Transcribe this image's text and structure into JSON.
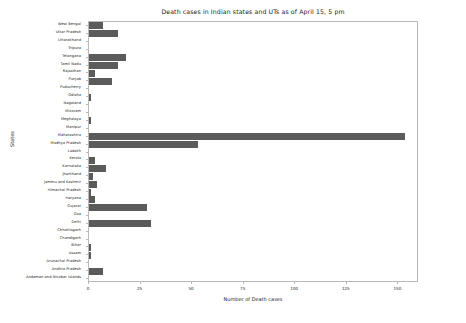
{
  "chart_data": {
    "type": "bar",
    "orientation": "horizontal",
    "title": "Death cases in Indian states and UTs as of April 15, 5 pm",
    "xlabel": "Number of Death cases",
    "ylabel": "States",
    "xlim": [
      0,
      160
    ],
    "ylim": [
      0,
      33
    ],
    "grid": false,
    "legend": null,
    "xticks": [
      0,
      25,
      50,
      75,
      100,
      125,
      150
    ],
    "xtick_labels": [
      "0",
      "25",
      "50",
      "75",
      "100",
      "125",
      "150"
    ],
    "bar_color": "#5b5b5b",
    "categories": [
      "West Bengal",
      "Uttar Pradesh",
      "Uttarakhand",
      "Tripura",
      "Telangana",
      "Tamil Nadu",
      "Rajasthan",
      "Punjab",
      "Puducherry",
      "Odisha",
      "Nagaland",
      "Mizoram",
      "Meghalaya",
      "Manipur",
      "Maharashtra",
      "Madhya Pradesh",
      "Ladakh",
      "Kerala",
      "Karnataka",
      "Jharkhand",
      "Jammu and Kashmir",
      "Himachal Pradesh",
      "Haryana",
      "Gujarat",
      "Goa",
      "Delhi",
      "Chhattisgarh",
      "Chandigarh",
      "Bihar",
      "Assam",
      "Arunachal Pradesh",
      "Andhra Pradesh",
      "Andaman and Nicobar Islands"
    ],
    "values": [
      7,
      14,
      0,
      0,
      18,
      14,
      3,
      11,
      0,
      1,
      0,
      0,
      1,
      0,
      153,
      53,
      0,
      3,
      8,
      2,
      4,
      1,
      3,
      28,
      0,
      30,
      0,
      0,
      1,
      1,
      0,
      7,
      0
    ]
  }
}
